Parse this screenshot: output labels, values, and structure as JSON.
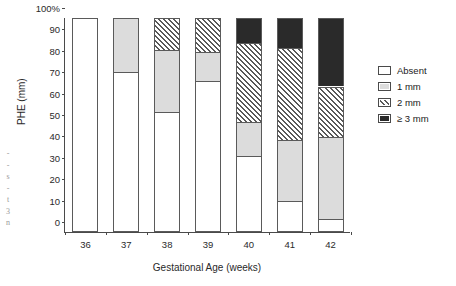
{
  "chart_data": {
    "type": "bar",
    "subtype": "stacked-percentage-bar",
    "title": "",
    "xlabel": "Gestational Age (weeks)",
    "ylabel": "PHE (mm)",
    "categories": [
      "36",
      "37",
      "38",
      "39",
      "40",
      "41",
      "42"
    ],
    "ylim": [
      0,
      100
    ],
    "ytick_labels": [
      "0",
      "10",
      "20",
      "30",
      "40",
      "50",
      "60",
      "70",
      "80",
      "90",
      "100%"
    ],
    "ytick_values": [
      0,
      10,
      20,
      30,
      40,
      50,
      60,
      70,
      80,
      90,
      100
    ],
    "grid": false,
    "legend_position": "right",
    "series": [
      {
        "name": "Absent",
        "pattern": "solid-white",
        "color": "#ffffff",
        "values": [
          100,
          75,
          56,
          70.5,
          35.5,
          14.5,
          6
        ]
      },
      {
        "name": "1 mm",
        "pattern": "solid-light-gray",
        "color": "#dcdcdc",
        "values": [
          0,
          25,
          29,
          13.5,
          16,
          28.5,
          38.5
        ]
      },
      {
        "name": "2 mm",
        "pattern": "diagonal-hatch",
        "color": "#585858",
        "values": [
          0,
          0,
          15,
          16,
          37,
          43,
          23.5
        ]
      },
      {
        "name": "≥ 3 mm",
        "pattern": "solid-dark",
        "color": "#2a2a2a",
        "values": [
          0,
          0,
          0,
          0,
          11.5,
          14,
          32
        ]
      }
    ],
    "cumulative_tops": {
      "36": [
        100,
        100,
        100,
        100
      ],
      "37": [
        75,
        100,
        100,
        100
      ],
      "38": [
        56,
        85,
        100,
        100
      ],
      "39": [
        70.5,
        84,
        100,
        100
      ],
      "40": [
        35.5,
        51.5,
        88.5,
        100
      ],
      "41": [
        14.5,
        43,
        86,
        100
      ],
      "42": [
        6,
        44.5,
        68,
        100
      ]
    }
  },
  "legend": {
    "items": [
      {
        "label": "Absent",
        "swatch": "white"
      },
      {
        "label": "1 mm",
        "swatch": "light-gray"
      },
      {
        "label": "2 mm",
        "swatch": "hatch"
      },
      {
        "label": "≥ 3 mm",
        "swatch": "dark"
      }
    ]
  },
  "page_bleed": {
    "lines": [
      "-",
      "-",
      "s",
      "-",
      "t",
      "3",
      "n"
    ]
  }
}
